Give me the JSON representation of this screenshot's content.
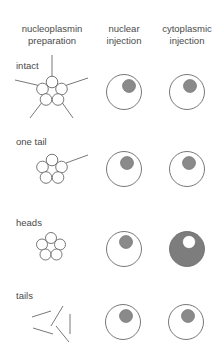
{
  "columns": [
    {
      "line1": "nucleoplasmin",
      "line2": "preparation"
    },
    {
      "line1": "nuclear",
      "line2": "injection"
    },
    {
      "line1": "cytoplasmic",
      "line2": "injection"
    }
  ],
  "rows": [
    {
      "label": "intact",
      "nuclear": "nucleus-labeled",
      "cytoplasmic": "nucleus-labeled"
    },
    {
      "label": "one tail",
      "nuclear": "nucleus-labeled",
      "cytoplasmic": "nucleus-labeled"
    },
    {
      "label": "heads",
      "nuclear": "nucleus-labeled",
      "cytoplasmic": "cytoplasm-labeled"
    },
    {
      "label": "tails",
      "nuclear": "nucleus-labeled",
      "cytoplasmic": "nucleus-labeled"
    }
  ],
  "colors": {
    "label_fill": "#8a8a8a",
    "outline": "#555555",
    "text": "#4a4a4a"
  }
}
